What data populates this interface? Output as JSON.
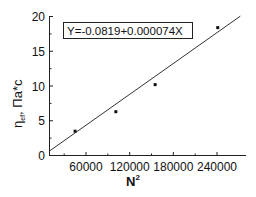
{
  "chart_data": {
    "type": "scatter",
    "title": "",
    "xlabel": "N",
    "xlabel_superscript": "2",
    "ylabel": "η",
    "ylabel_subscript": "ef",
    "ylabel_suffix": ", Па*с",
    "xlim": [
      10000,
      278000
    ],
    "ylim": [
      0,
      20
    ],
    "x_ticks": [
      60000,
      120000,
      180000,
      240000
    ],
    "x_tick_labels": [
      "60000",
      "120000",
      "180000",
      "240000"
    ],
    "y_ticks": [
      0,
      5,
      10,
      15,
      20
    ],
    "y_tick_labels": [
      "0",
      "5",
      "10",
      "15",
      "20"
    ],
    "grid": false,
    "legend": null,
    "series": [
      {
        "name": "data",
        "marker": "square",
        "x": [
          45000,
          101000,
          155000,
          241000
        ],
        "y": [
          3.5,
          6.3,
          10.2,
          18.4
        ]
      },
      {
        "name": "linear fit",
        "style": "line",
        "intercept": -0.0819,
        "slope": 7.4e-05,
        "x_range": [
          10000,
          272000
        ]
      }
    ],
    "annotations": [
      {
        "text": "Y=-0.0819+0.000074X",
        "boxed": true,
        "position": "top-left"
      }
    ]
  }
}
